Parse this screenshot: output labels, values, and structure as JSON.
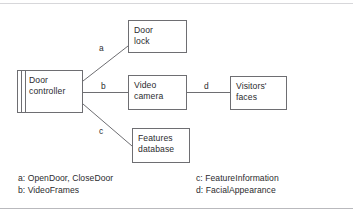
{
  "figure": {
    "line_color": "#6e6e72",
    "text_color": "#2b2b2e",
    "background": "#ffffff"
  },
  "nodes": [
    {
      "id": "door-controller",
      "kind": "component",
      "line1": "Door",
      "line2": "controller"
    },
    {
      "id": "door-lock",
      "kind": "box",
      "line1": "Door",
      "line2": "lock"
    },
    {
      "id": "video-camera",
      "kind": "box",
      "line1": "Video",
      "line2": "camera"
    },
    {
      "id": "features-database",
      "kind": "box",
      "line1": "Features",
      "line2": "database"
    },
    {
      "id": "visitors-faces",
      "kind": "box",
      "line1": "Visitors'",
      "line2": "faces"
    }
  ],
  "edges": [
    {
      "id": "a",
      "label": "a",
      "from": "door-controller",
      "to": "door-lock"
    },
    {
      "id": "b",
      "label": "b",
      "from": "door-controller",
      "to": "video-camera"
    },
    {
      "id": "c",
      "label": "c",
      "from": "door-controller",
      "to": "features-database"
    },
    {
      "id": "d",
      "label": "d",
      "from": "video-camera",
      "to": "visitors-faces"
    }
  ],
  "legend": {
    "left": [
      "a: OpenDoor, CloseDoor",
      "b: VideoFrames"
    ],
    "right": [
      "c: FeatureInformation",
      "d: FacialAppearance"
    ]
  }
}
